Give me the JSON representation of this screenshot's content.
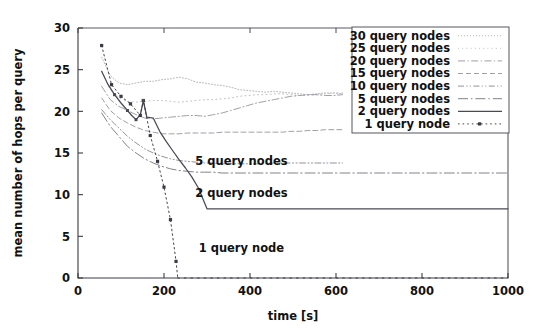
{
  "figure": {
    "background": "#ffffff",
    "width": 546,
    "height": 330
  },
  "axes": {
    "x_title": "time [s]",
    "y_title": "mean number of hops per query",
    "x_ticks": [
      "0",
      "200",
      "400",
      "600",
      "800",
      "1000"
    ],
    "y_ticks": [
      "0",
      "5",
      "10",
      "15",
      "20",
      "25",
      "30"
    ]
  },
  "legend": {
    "items": [
      {
        "label": "30 query nodes",
        "style": "dotted-fine",
        "color": "#a8a8b0"
      },
      {
        "label": "25 query nodes",
        "style": "dotted-sparse",
        "color": "#b5b5bd"
      },
      {
        "label": "20 query nodes",
        "style": "dashdot",
        "color": "#9b9ba4"
      },
      {
        "label": "15 query nodes",
        "style": "dashed",
        "color": "#8e8e98"
      },
      {
        "label": "10 query nodes",
        "style": "dashdotdot",
        "color": "#86868f"
      },
      {
        "label": "5 query nodes",
        "style": "dashdot-long",
        "color": "#7b7b85"
      },
      {
        "label": "2 query nodes",
        "style": "solid",
        "color": "#4a4a55"
      },
      {
        "label": "1 query node",
        "style": "dotted-marker",
        "color": "#3a3a45"
      }
    ]
  },
  "annotations": [
    {
      "text": "5 query nodes",
      "x": 380,
      "y": 13.6
    },
    {
      "text": "2 query nodes",
      "x": 380,
      "y": 9.7
    },
    {
      "text": "1 query node",
      "x": 380,
      "y": 3.1
    }
  ],
  "chart_data": {
    "type": "line",
    "title": "",
    "xlabel": "time [s]",
    "ylabel": "mean number of hops per query",
    "xlim": [
      0,
      1000
    ],
    "ylim": [
      0,
      30
    ],
    "xticks": [
      0,
      200,
      400,
      600,
      800,
      1000
    ],
    "yticks": [
      0,
      5,
      10,
      15,
      20,
      25,
      30
    ],
    "grid": false,
    "legend_position": "upper right",
    "annotations": [
      "5 query nodes",
      "2 query nodes",
      "1 query node"
    ],
    "series": [
      {
        "name": "30 query nodes",
        "style": "dotted-fine",
        "x": [
          55,
          75,
          95,
          115,
          135,
          155,
          175,
          195,
          215,
          235,
          255,
          275,
          295,
          315,
          335,
          355,
          375,
          395,
          415,
          435,
          455,
          475,
          495,
          515,
          535,
          555,
          575,
          595,
          615
        ],
        "y": [
          26.5,
          24.3,
          23.4,
          23.2,
          23.4,
          23.6,
          23.6,
          23.8,
          23.9,
          24.1,
          23.9,
          23.5,
          23.4,
          23.2,
          23.1,
          22.9,
          22.6,
          22.5,
          22.4,
          22.3,
          22.4,
          22.3,
          22.2,
          22.1,
          22.0,
          22.1,
          22.2,
          22.2,
          22.1
        ]
      },
      {
        "name": "25 query nodes",
        "style": "dotted-sparse",
        "x": [
          55,
          75,
          95,
          115,
          135,
          155,
          175,
          195,
          215,
          235,
          255,
          275,
          295,
          315,
          335,
          355,
          375,
          395,
          415,
          435,
          455,
          475,
          495,
          515,
          535,
          555,
          575,
          595,
          615
        ],
        "y": [
          24.8,
          22.6,
          21.6,
          21.2,
          21.1,
          21.2,
          21.3,
          21.3,
          21.2,
          21.1,
          21.2,
          21.3,
          21.4,
          21.4,
          21.5,
          21.6,
          21.8,
          21.9,
          22.0,
          22.0,
          22.1,
          22.1,
          22.0,
          21.9,
          21.9,
          22.0,
          22.1,
          22.2,
          22.2
        ]
      },
      {
        "name": "20 query nodes",
        "style": "dashdot",
        "x": [
          55,
          75,
          95,
          115,
          135,
          155,
          175,
          195,
          215,
          235,
          255,
          275,
          295,
          315,
          335,
          355,
          375,
          395,
          415,
          435,
          455,
          475,
          495,
          515,
          535,
          555,
          575,
          595,
          615
        ],
        "y": [
          23.0,
          21.4,
          20.6,
          20.1,
          19.6,
          19.2,
          19.1,
          19.2,
          19.3,
          19.4,
          19.5,
          19.5,
          19.4,
          19.6,
          19.8,
          20.1,
          20.4,
          20.7,
          21.0,
          21.2,
          21.4,
          21.6,
          21.8,
          21.9,
          22.0,
          22.0,
          21.9,
          21.9,
          22.0
        ]
      },
      {
        "name": "15 query nodes",
        "style": "dashed",
        "x": [
          55,
          75,
          95,
          115,
          135,
          155,
          175,
          195,
          215,
          235,
          255,
          275,
          295,
          315,
          335,
          355,
          375,
          395,
          415,
          435,
          455,
          475,
          495,
          515,
          535,
          555,
          575,
          595,
          615
        ],
        "y": [
          21.6,
          20.1,
          19.2,
          18.6,
          18.1,
          17.7,
          17.5,
          17.3,
          17.3,
          17.3,
          17.4,
          17.4,
          17.4,
          17.4,
          17.5,
          17.5,
          17.5,
          17.5,
          17.5,
          17.5,
          17.5,
          17.5,
          17.6,
          17.6,
          17.7,
          17.7,
          17.8,
          17.8,
          17.8
        ]
      },
      {
        "name": "10 query nodes",
        "style": "dashdotdot",
        "x": [
          55,
          75,
          95,
          115,
          135,
          155,
          175,
          195,
          215,
          235,
          255,
          275,
          295,
          315,
          335,
          355,
          375,
          395,
          415,
          435,
          455,
          475,
          495,
          515,
          535,
          555,
          575,
          595,
          615
        ],
        "y": [
          20.2,
          19.0,
          18.0,
          17.0,
          16.2,
          15.5,
          15.0,
          14.6,
          14.3,
          14.1,
          14.0,
          13.9,
          13.8,
          13.8,
          13.7,
          13.7,
          13.7,
          13.7,
          13.7,
          13.7,
          13.8,
          13.8,
          13.8,
          13.8,
          13.8,
          13.8,
          13.8,
          13.8,
          13.8
        ]
      },
      {
        "name": "5 query nodes",
        "style": "dashdot-long",
        "x": [
          55,
          75,
          95,
          115,
          135,
          155,
          175,
          195,
          215,
          235,
          255,
          275,
          295,
          315,
          335,
          400,
          470,
          540,
          610,
          680,
          750,
          820,
          890,
          960,
          1000
        ],
        "y": [
          19.8,
          18.2,
          17.0,
          15.8,
          15.0,
          14.3,
          13.8,
          13.4,
          13.1,
          12.9,
          12.8,
          12.7,
          12.7,
          12.7,
          12.6,
          12.6,
          12.6,
          12.6,
          12.6,
          12.6,
          12.6,
          12.6,
          12.6,
          12.6,
          12.6
        ]
      },
      {
        "name": "2 query nodes",
        "style": "solid",
        "x": [
          55,
          70,
          85,
          100,
          115,
          125,
          135,
          145,
          152,
          160,
          175,
          190,
          205,
          220,
          235,
          250,
          265,
          280,
          300,
          400,
          500,
          600,
          700,
          800,
          900,
          1000
        ],
        "y": [
          24.8,
          23.2,
          22.0,
          21.0,
          20.1,
          19.5,
          19.0,
          19.6,
          21.3,
          19.3,
          19.2,
          17.6,
          16.4,
          15.3,
          14.2,
          13.2,
          12.1,
          10.8,
          8.3,
          8.3,
          8.3,
          8.3,
          8.3,
          8.3,
          8.3,
          8.3
        ]
      },
      {
        "name": "1 query node",
        "style": "dotted-marker",
        "x": [
          55,
          78,
          100,
          122,
          145,
          152,
          168,
          185,
          200,
          215,
          228,
          232
        ],
        "y": [
          27.9,
          23.2,
          21.8,
          20.9,
          19.5,
          21.3,
          17.1,
          14.0,
          10.9,
          7.0,
          2.0,
          0.0
        ],
        "markers_at": [
          55,
          78,
          100,
          122,
          145,
          152,
          168,
          185,
          200,
          215,
          228
        ],
        "zero_tail_x": [
          232,
          1000
        ],
        "zero_tail_y": 0
      }
    ]
  }
}
